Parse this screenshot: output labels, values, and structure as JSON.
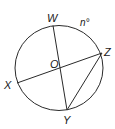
{
  "diagram": {
    "type": "circle-geometry",
    "circle": {
      "center_label": "O",
      "cx": 59,
      "cy": 68,
      "rx": 44,
      "ry": 42
    },
    "points": {
      "W": {
        "label": "W",
        "x": 53,
        "y": 25
      },
      "X": {
        "label": "X",
        "x": 17,
        "y": 83
      },
      "Y": {
        "label": "Y",
        "x": 67,
        "y": 110
      },
      "Z": {
        "label": "Z",
        "x": 102,
        "y": 53
      }
    },
    "segments": [
      {
        "from": "W",
        "to": "Y",
        "kind": "diameter"
      },
      {
        "from": "X",
        "to": "Z",
        "kind": "diameter"
      },
      {
        "from": "Z",
        "to": "Y",
        "kind": "chord"
      }
    ],
    "arc_label": {
      "text": "n°",
      "arc": "WZ"
    },
    "colors": {
      "stroke": "#1a1a1a",
      "background": "#ffffff"
    }
  }
}
